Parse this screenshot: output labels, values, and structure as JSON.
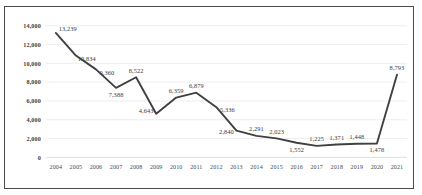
{
  "chart_data": {
    "type": "line",
    "title": "",
    "xlabel": "",
    "ylabel": "",
    "grid": true,
    "legend": false,
    "ylim": [
      0,
      14000
    ],
    "yticks": [
      "0",
      "2,000",
      "4,000",
      "6,000",
      "8,000",
      "10,000",
      "12,000",
      "14,000"
    ],
    "ytick_values": [
      0,
      2000,
      4000,
      6000,
      8000,
      10000,
      12000,
      14000
    ],
    "categories": [
      "2004",
      "2005",
      "2006",
      "2007",
      "2008",
      "2009",
      "2010",
      "2011",
      "2012",
      "2013",
      "2014",
      "2015",
      "2016",
      "2017",
      "2018",
      "2019",
      "2020",
      "2021"
    ],
    "values": [
      13239,
      10834,
      9360,
      7388,
      8522,
      4643,
      6359,
      6879,
      5336,
      2840,
      2291,
      2023,
      1552,
      1225,
      1371,
      1448,
      1478,
      8793
    ],
    "point_labels": [
      "13,239",
      "10,834",
      "9,360",
      "7,388",
      "8,522",
      "4,643",
      "6,359",
      "6,879",
      "5,336",
      "2,840",
      "2,291",
      "2,023",
      "1,552",
      "1,225",
      "1,371",
      "1,448",
      "1,478",
      "8,793"
    ],
    "label_positions": [
      "right-top",
      "right-bottom",
      "right-bottom",
      "below",
      "above",
      "left-above",
      "above",
      "above",
      "right-below",
      "left-below",
      "above",
      "above",
      "below",
      "above",
      "above",
      "above",
      "below",
      "above"
    ],
    "series_color": "#404040",
    "grid_color": "#e9e9e9",
    "border_color": "#4a4a4a"
  }
}
